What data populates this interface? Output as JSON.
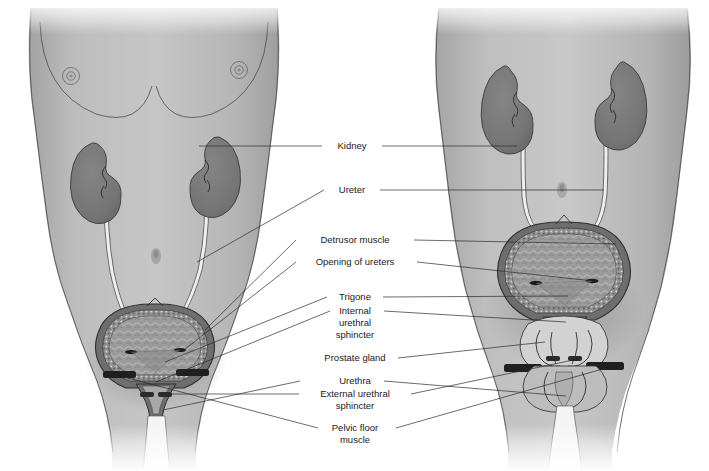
{
  "figure": {
    "subjects": [
      {
        "name": "female-figure",
        "side": "left"
      },
      {
        "name": "male-figure",
        "side": "right"
      }
    ]
  },
  "palette": {
    "background": "#ffffff",
    "body_fill": "#b9b9b9",
    "body_fill_light": "#c9c9c9",
    "body_shadow": "#9a9a9a",
    "kidney_fill": "#777777",
    "kidney_stroke": "#3c3c3c",
    "bladder_lumen": "#9c9c9c",
    "bladder_wall": "#6e6e6e",
    "ureter_fill": "#efefef",
    "urethra_fill": "#f2f2f2",
    "prostate_fill": "#d8d8d8",
    "muscle_bar": "#1f1f1f",
    "leader_line": "#2b2b2b",
    "label_text": "#1a1a1a",
    "outline": "#4a4a4a"
  },
  "labels": [
    {
      "id": "kidney",
      "name": "label-kidney",
      "text": "Kidney",
      "lines": [
        "Kidney"
      ],
      "x": 352,
      "y": 146
    },
    {
      "id": "ureter",
      "name": "label-ureter",
      "text": "Ureter",
      "lines": [
        "Ureter"
      ],
      "x": 352,
      "y": 190
    },
    {
      "id": "detrusor-muscle",
      "name": "label-detrusor-muscle",
      "text": "Detrusor muscle",
      "lines": [
        "Detrusor muscle"
      ],
      "x": 355,
      "y": 240
    },
    {
      "id": "opening-of-ureters",
      "name": "label-opening-of-ureters",
      "text": "Opening of ureters",
      "lines": [
        "Opening of ureters"
      ],
      "x": 355,
      "y": 262
    },
    {
      "id": "trigone",
      "name": "label-trigone",
      "text": "Trigone",
      "lines": [
        "Trigone"
      ],
      "x": 355,
      "y": 297
    },
    {
      "id": "internal-urethral-sphincter",
      "name": "label-internal-urethral-sphincter",
      "text": "Internal urethral sphincter",
      "lines": [
        "Internal",
        "urethral",
        "sphincter"
      ],
      "x": 355,
      "y": 318
    },
    {
      "id": "prostate-gland",
      "name": "label-prostate-gland",
      "text": "Prostate gland",
      "lines": [
        "Prostate gland"
      ],
      "x": 355,
      "y": 358
    },
    {
      "id": "urethra",
      "name": "label-urethra",
      "text": "Urethra",
      "lines": [
        "Urethra"
      ],
      "x": 355,
      "y": 381
    },
    {
      "id": "external-urethral-sphincter",
      "name": "label-external-urethral-sphincter",
      "text": "External urethral sphincter",
      "lines": [
        "External urethral",
        "sphincter"
      ],
      "x": 355,
      "y": 400
    },
    {
      "id": "pelvic-floor-muscle",
      "name": "label-pelvic-floor-muscle",
      "text": "Pelvic floor muscle",
      "lines": [
        "Pelvic floor",
        "muscle"
      ],
      "x": 355,
      "y": 434
    }
  ],
  "structures": {
    "female": {
      "kidney_left": "kidney-left-female",
      "kidney_right": "kidney-right-female",
      "ureter_left": "ureter-left-female",
      "ureter_right": "ureter-right-female",
      "bladder": "bladder-female",
      "urethra": "urethra-female",
      "navel": "navel-female",
      "breasts": "breasts-female"
    },
    "male": {
      "kidney_left": "kidney-left-male",
      "kidney_right": "kidney-right-male",
      "ureter_left": "ureter-left-male",
      "ureter_right": "ureter-right-male",
      "bladder": "bladder-male",
      "prostate": "prostate-male",
      "urethra": "urethra-male",
      "penis": "penis-male",
      "navel": "navel-male"
    }
  }
}
